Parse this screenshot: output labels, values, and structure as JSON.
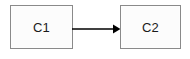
{
  "diagram": {
    "type": "flow-diagram",
    "background_color": "#ffffff",
    "nodes": [
      {
        "id": "c1",
        "label": "C1",
        "shape": "rectangle",
        "fill_color": "#fcfcfc",
        "border_color": "#8a8a8a",
        "text_color": "#1b1b1b"
      },
      {
        "id": "c2",
        "label": "C2",
        "shape": "rectangle",
        "fill_color": "#fcfcfc",
        "border_color": "#8a8a8a",
        "text_color": "#1b1b1b"
      }
    ],
    "edges": [
      {
        "id": "c1-to-c2",
        "from": "c1",
        "to": "c2",
        "label": "",
        "style": "solid",
        "arrowhead": "filled-triangle",
        "color": "#000000"
      }
    ]
  }
}
